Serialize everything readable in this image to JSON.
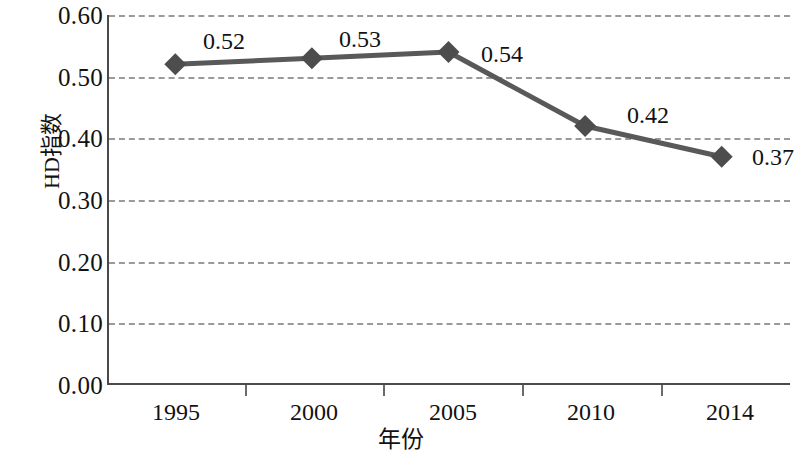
{
  "chart_data": {
    "type": "line",
    "title": "",
    "subtitle": "",
    "xlabel": "年份",
    "ylabel": "HD指数",
    "categories": [
      "1995",
      "2000",
      "2005",
      "2010",
      "2014"
    ],
    "values": [
      0.52,
      0.53,
      0.54,
      0.42,
      0.37
    ],
    "point_labels": [
      "0.52",
      "0.53",
      "0.54",
      "0.42",
      "0.37"
    ],
    "series": [
      {
        "name": "HD指数",
        "values": [
          0.52,
          0.53,
          0.54,
          0.42,
          0.37
        ]
      }
    ],
    "ylim": [
      0.0,
      0.6
    ],
    "ytick_labels": [
      "0.60",
      "0.50",
      "0.40",
      "0.30",
      "0.20",
      "0.10",
      "0.00"
    ],
    "ytick_values": [
      0.6,
      0.5,
      0.4,
      0.3,
      0.2,
      0.1,
      0.0
    ],
    "grid": "horizontal-dashed",
    "legend": "none",
    "marker": "diamond",
    "colors": {
      "line": "#595959",
      "marker": "#4d4d4d",
      "grid": "#9a9a9a",
      "axis": "#4a4a4a",
      "text": "#121212",
      "background": "#ffffff"
    }
  }
}
